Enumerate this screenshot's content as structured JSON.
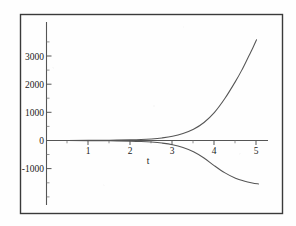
{
  "chart_data": {
    "type": "line",
    "title": "",
    "subtitle": "",
    "xlabel": "t",
    "ylabel": "",
    "xlim": [
      0,
      5.35
    ],
    "ylim": [
      -1550,
      3600
    ],
    "grid": false,
    "legend": null,
    "x_ticks": [
      1,
      2,
      3,
      4,
      5
    ],
    "x_tick_labels": [
      "1",
      "2",
      "3",
      "4",
      "5"
    ],
    "y_ticks": [
      -1000,
      0,
      1000,
      2000,
      3000
    ],
    "y_tick_labels": [
      "-1000",
      "0",
      "1000",
      "2000",
      "3000"
    ],
    "x_minor_ticks": [
      0.5,
      1.5,
      2.5,
      3.5,
      4.5
    ],
    "y_minor_ticks": [
      -500,
      500,
      1500,
      2500,
      3500
    ],
    "series": [
      {
        "name": "rising-exponential",
        "color": "#555555",
        "style": "solid",
        "x": [
          0.0,
          0.5,
          1.0,
          1.5,
          2.0,
          2.25,
          2.5,
          2.75,
          3.0,
          3.25,
          3.5,
          3.75,
          4.0,
          4.25,
          4.5,
          4.65,
          4.8,
          4.9,
          5.0
        ],
        "y": [
          2,
          3,
          6,
          11,
          22,
          33,
          55,
          92,
          150,
          250,
          400,
          640,
          1000,
          1500,
          2100,
          2500,
          2950,
          3250,
          3580
        ]
      },
      {
        "name": "falling-exponential",
        "color": "#555555",
        "style": "solid",
        "x": [
          0.0,
          0.5,
          1.0,
          1.5,
          2.0,
          2.25,
          2.5,
          2.75,
          3.0,
          3.25,
          3.5,
          3.75,
          4.0,
          4.25,
          4.5,
          4.7,
          4.9,
          5.05
        ],
        "y": [
          -2,
          -3,
          -6,
          -11,
          -22,
          -33,
          -55,
          -92,
          -150,
          -250,
          -400,
          -620,
          -900,
          -1150,
          -1340,
          -1440,
          -1510,
          -1545
        ]
      }
    ]
  },
  "figure": {
    "frame_color": "#3a3a3a",
    "axis_color": "#555555",
    "background": "#fefefe"
  }
}
